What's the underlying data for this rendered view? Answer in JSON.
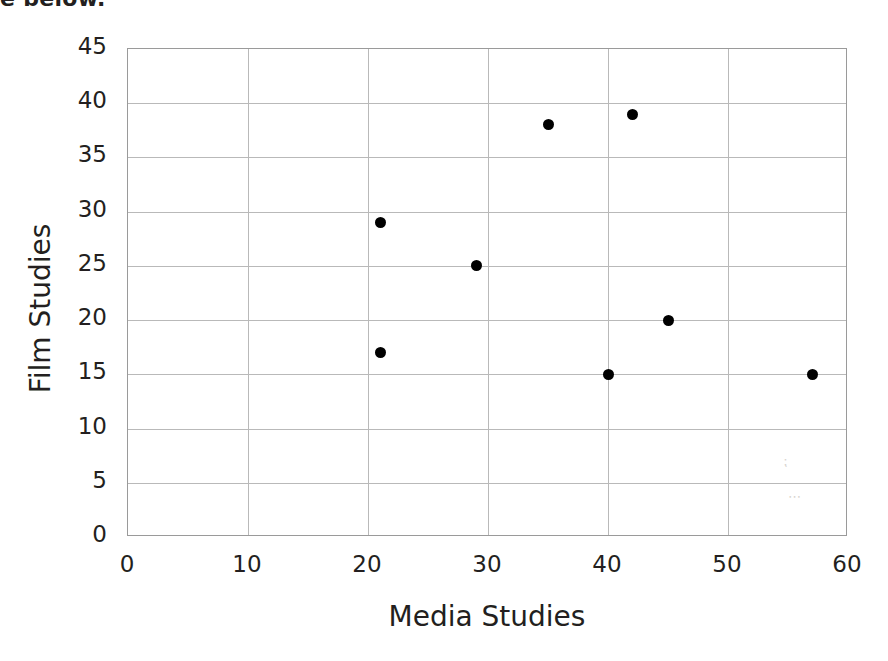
{
  "caption": {
    "fragment_text": "e below."
  },
  "chart_data": {
    "type": "scatter",
    "title": "",
    "subtitle": "",
    "xlabel": "Media Studies",
    "ylabel": "Film Studies",
    "xlim": [
      0,
      60
    ],
    "ylim": [
      0,
      45
    ],
    "xticks": [
      0,
      10,
      20,
      30,
      40,
      50,
      60
    ],
    "yticks": [
      0,
      5,
      10,
      15,
      20,
      25,
      30,
      35,
      40,
      45
    ],
    "xtick_labels": [
      "0",
      "10",
      "20",
      "30",
      "40",
      "50",
      "60"
    ],
    "ytick_labels": [
      "0",
      "5",
      "10",
      "15",
      "20",
      "25",
      "30",
      "35",
      "40",
      "45"
    ],
    "grid": true,
    "legend": null,
    "legend_position": "none",
    "marker": "filled-circle",
    "marker_color": "#000000",
    "gridline_color": "#b9b9b9",
    "axis_border_color": "#9a9a9a",
    "background_color": "#ffffff",
    "points": [
      {
        "x": 21,
        "y": 29
      },
      {
        "x": 21,
        "y": 17
      },
      {
        "x": 29,
        "y": 25
      },
      {
        "x": 35,
        "y": 38
      },
      {
        "x": 42,
        "y": 39
      },
      {
        "x": 40,
        "y": 15
      },
      {
        "x": 45,
        "y": 20
      },
      {
        "x": 57,
        "y": 15
      }
    ],
    "series": [
      {
        "name": "Students",
        "x": [
          21,
          21,
          29,
          35,
          42,
          40,
          45,
          57
        ],
        "values": [
          29,
          17,
          25,
          38,
          39,
          15,
          20,
          15
        ]
      }
    ]
  }
}
